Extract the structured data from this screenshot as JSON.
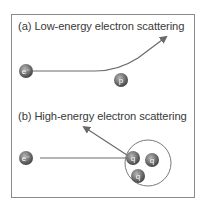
{
  "diagram": {
    "panel_a": {
      "title": "(a) Low-energy electron scattering",
      "electron_label": "e⁻",
      "target_label": "p"
    },
    "panel_b": {
      "title": "(b) High-energy electron scattering",
      "electron_label": "e⁻",
      "quark_labels": [
        "q",
        "q",
        "q"
      ]
    },
    "colors": {
      "frame": "#8a8a8a",
      "particle": "#6b6b6b",
      "trajectory": "#6a6a6a",
      "text": "#3a3a3a"
    }
  }
}
